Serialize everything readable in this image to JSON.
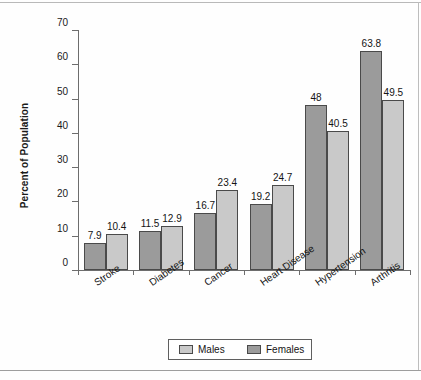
{
  "chart_data": {
    "type": "bar",
    "title": "",
    "subtitle": "",
    "xlabel": "",
    "ylabel": "Percent of Population",
    "ylim": [
      0,
      70
    ],
    "yticks": [
      0,
      10,
      20,
      30,
      40,
      50,
      60,
      70
    ],
    "ytick_labels": [
      "0",
      "10",
      "20",
      "30",
      "40",
      "50",
      "60",
      "70"
    ],
    "grid": false,
    "legend_position": "bottom-center",
    "categories": [
      "Stroke",
      "Diabetes",
      "Cancer",
      "Heart Disease",
      "Hypertension",
      "Arthritis"
    ],
    "series": [
      {
        "name": "Males",
        "color": "#c9c9c9",
        "values": [
          10.4,
          12.9,
          23.4,
          24.7,
          40.5,
          49.5
        ],
        "labels": [
          "10.4",
          "12.9",
          "23.4",
          "24.7",
          "40.5",
          "49.5"
        ]
      },
      {
        "name": "Females",
        "color": "#9b9b9b",
        "values": [
          7.9,
          11.5,
          16.7,
          19.2,
          48.0,
          63.8
        ],
        "labels": [
          "7.9",
          "11.5",
          "16.7",
          "19.2",
          "48",
          "63.8"
        ]
      }
    ],
    "series_draw_order": [
      "Females",
      "Males"
    ]
  },
  "legend": {
    "items": [
      {
        "label": "Males",
        "swatch": "males"
      },
      {
        "label": "Females",
        "swatch": "females"
      }
    ]
  }
}
